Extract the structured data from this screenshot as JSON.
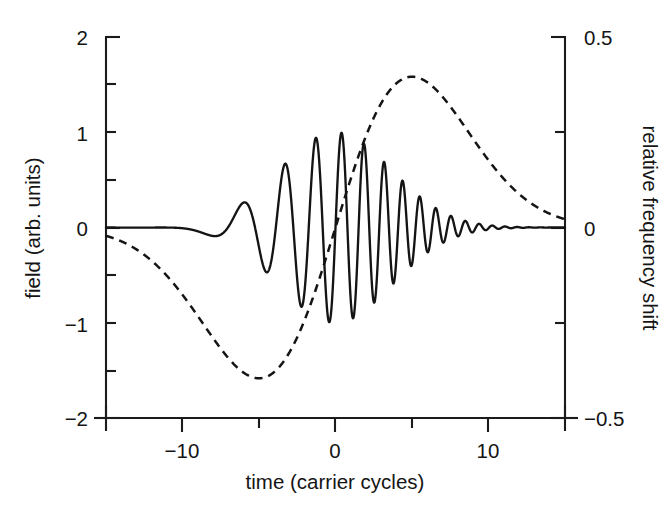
{
  "figure": {
    "background_color": "#ffffff",
    "ink_color": "#141414",
    "width": 671,
    "height": 507
  },
  "axes": {
    "left": {
      "title": "field (arb. units)",
      "tick_labels": [
        "2",
        "1",
        "0",
        "-1",
        "-2"
      ],
      "tick_values": [
        2,
        1,
        0,
        -1,
        -2
      ],
      "minor_tick_values": [
        1.5,
        0.5,
        -0.5,
        -1.5
      ],
      "range": [
        -2,
        2
      ]
    },
    "right": {
      "title": "relative frequency shift",
      "tick_labels": [
        "0.5",
        "0",
        "-0.5"
      ],
      "tick_values": [
        0.5,
        0,
        -0.5
      ],
      "minor_tick_values": [
        0.25,
        -0.25
      ],
      "range": [
        -0.5,
        0.5
      ]
    },
    "bottom": {
      "title": "time (carrier cycles)",
      "tick_labels": [
        "-10",
        "0",
        "10"
      ],
      "tick_values": [
        -10,
        0,
        10
      ],
      "minor_tick_values": [
        -5,
        5
      ],
      "range": [
        -15,
        15
      ]
    }
  },
  "chart_data": {
    "type": "line",
    "title": "",
    "xlabel": "time (carrier cycles)",
    "ylabel": "field (arb. units)",
    "y2label": "relative frequency shift",
    "xlim": [
      -15,
      15
    ],
    "ylim": [
      -2,
      2
    ],
    "y2lim": [
      -0.5,
      0.5
    ],
    "grid": false,
    "legend": "none",
    "series": [
      {
        "name": "field",
        "axis": "left",
        "style": "solid",
        "color": "#141414",
        "description": "Gaussian-envelope chirped carrier wave; envelope peak amplitude 1 near t = 0, instantaneous frequency increases with time",
        "model": {
          "kind": "chirped_gaussian",
          "envelope_amplitude": 1.0,
          "envelope_center": 0.0,
          "envelope_sigma": 5.2,
          "carrier_cycles_per_unit_at_center": 0.62,
          "chirp_rate": 0.055,
          "phase_offset": 0.0
        },
        "samples_x": [
          -15,
          -13,
          -11,
          -9,
          -7,
          -5,
          -3,
          -1,
          0,
          1,
          3,
          5,
          7,
          9,
          11,
          13,
          15
        ],
        "envelope_y": [
          0.02,
          0.05,
          0.1,
          0.22,
          0.4,
          0.62,
          0.84,
          0.98,
          1.0,
          0.98,
          0.84,
          0.62,
          0.4,
          0.22,
          0.1,
          0.05,
          0.02
        ]
      },
      {
        "name": "relative frequency shift",
        "axis": "right",
        "style": "dashed",
        "color": "#141414",
        "description": "Odd, derivative-of-Gaussian shaped frequency sweep: dips to about -0.36 near t = -3.5, rises to about +0.36 near t = +3.5",
        "model": {
          "kind": "derivative_gaussian",
          "peak_value_right_axis": 0.36,
          "peak_value_left_axis_equivalent": 1.43,
          "peak_time": 3.5,
          "trough_time": -3.5,
          "sigma": 5.0
        },
        "key_points": [
          {
            "t": -15,
            "y2": -0.005
          },
          {
            "t": -12,
            "y2": -0.03
          },
          {
            "t": -10,
            "y2": -0.07
          },
          {
            "t": -8,
            "y2": -0.15
          },
          {
            "t": -6,
            "y2": -0.26
          },
          {
            "t": -5,
            "y2": -0.32
          },
          {
            "t": -3.5,
            "y2": -0.36
          },
          {
            "t": -2,
            "y2": -0.29
          },
          {
            "t": -1,
            "y2": -0.2
          },
          {
            "t": 0,
            "y2": 0.0
          },
          {
            "t": 1,
            "y2": 0.2
          },
          {
            "t": 2,
            "y2": 0.29
          },
          {
            "t": 3.5,
            "y2": 0.36
          },
          {
            "t": 5,
            "y2": 0.32
          },
          {
            "t": 6,
            "y2": 0.26
          },
          {
            "t": 8,
            "y2": 0.15
          },
          {
            "t": 10,
            "y2": 0.07
          },
          {
            "t": 12,
            "y2": 0.03
          },
          {
            "t": 15,
            "y2": 0.005
          }
        ]
      }
    ]
  }
}
